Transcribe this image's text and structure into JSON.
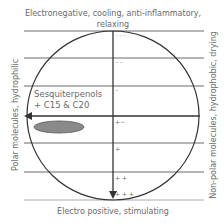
{
  "labels": {
    "top_line1": "Electronegative, cooling, anti-inflammatory,",
    "top_line2": "relaxing",
    "bottom": "Electro positive, stimulating",
    "left": "Polar molecules, hydrophilic",
    "right": "Non-polar molecules, hydrophobic, drying",
    "compound_line1": "Sesquiterpenols",
    "compound_line2": "+ C15 & C20"
  },
  "regions": [
    {
      "mark": "− − −"
    },
    {
      "mark": "− −"
    },
    {
      "mark": "−"
    },
    {
      "mark": "+−"
    },
    {
      "mark": "+"
    },
    {
      "mark": "+ +"
    },
    {
      "mark": "+ + +"
    }
  ],
  "colors": {
    "line": "#555555",
    "axis": "#333333",
    "circle": "#333333",
    "ellipse_fill": "#8a8a8a",
    "ellipse_stroke": "#555555",
    "text": "#6a6a6a"
  }
}
